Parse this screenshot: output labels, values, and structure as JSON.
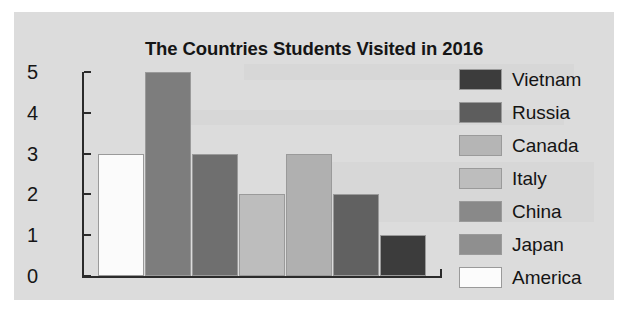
{
  "chart_data": {
    "type": "bar",
    "title": "The Countries Students Visited in 2016",
    "xlabel": "",
    "ylabel": "",
    "ylim": [
      0,
      5
    ],
    "ytick_labels": [
      "5",
      "4",
      "3",
      "2",
      "1",
      "0"
    ],
    "grid": false,
    "legend_position": "right",
    "categories": [
      "America",
      "China",
      "Russia",
      "Italy",
      "Japan",
      "Vietnam",
      "Canada"
    ],
    "values": [
      3,
      5,
      3,
      2,
      3,
      2,
      1
    ],
    "bars": [
      {
        "label": "America",
        "value": 3,
        "color": "#fbfbfb"
      },
      {
        "label": "China",
        "value": 5,
        "color": "#7d7d7d"
      },
      {
        "label": "Russia",
        "value": 3,
        "color": "#6f6f6f"
      },
      {
        "label": "Italy",
        "value": 2,
        "color": "#bdbdbd"
      },
      {
        "label": "Japan",
        "value": 3,
        "color": "#b0b0b0"
      },
      {
        "label": "Vietnam",
        "value": 2,
        "color": "#616161"
      },
      {
        "label": "Canada",
        "value": 1,
        "color": "#3c3c3c"
      }
    ],
    "legend": [
      {
        "label": "Vietnam",
        "color": "#3c3c3c"
      },
      {
        "label": "Russia",
        "color": "#5d5d5d"
      },
      {
        "label": "Canada",
        "color": "#b5b5b5"
      },
      {
        "label": "Italy",
        "color": "#bdbdbd"
      },
      {
        "label": "China",
        "color": "#898989"
      },
      {
        "label": "Japan",
        "color": "#8f8f8f"
      },
      {
        "label": "America",
        "color": "#fcfcfc"
      }
    ]
  },
  "ticks": [
    {
      "label": "5"
    },
    {
      "label": "4"
    },
    {
      "label": "3"
    },
    {
      "label": "2"
    },
    {
      "label": "1"
    },
    {
      "label": "0"
    }
  ]
}
